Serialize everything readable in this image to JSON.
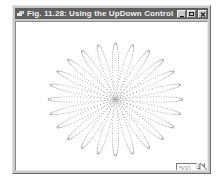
{
  "window": {
    "title": "Fig. 11.28: Using the UpDown Control",
    "icon": "app-icon",
    "buttons": [
      {
        "name": "minimize",
        "icon": "minimize-icon"
      },
      {
        "name": "maximize",
        "icon": "maximize-icon"
      },
      {
        "name": "close",
        "icon": "close-icon"
      }
    ],
    "colors": {
      "titlebar": "#5f5f5f",
      "title_text": "#f2f2f2",
      "frame": "#c8c8c8",
      "client": "#ffffff",
      "curve": "#a8a8a8"
    }
  },
  "canvas": {
    "drawing": "dotted rose curve",
    "petals": 24,
    "center": [
      99,
      77
    ],
    "radius": 64
  },
  "updown": {
    "value": "500",
    "up_icon": "arrow-up-icon",
    "down_icon": "arrow-down-icon"
  },
  "cursor": {
    "icon": "mouse-pointer-icon"
  }
}
